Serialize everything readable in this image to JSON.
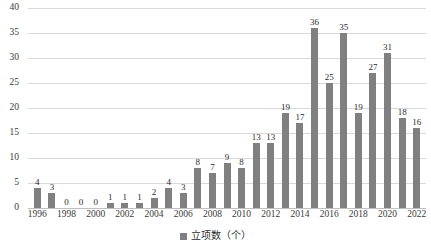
{
  "chart_data": {
    "type": "bar",
    "title": "",
    "subtitle": "",
    "xlabel": "",
    "ylabel": "",
    "ylim": [
      0,
      40
    ],
    "y_ticks": [
      0,
      5,
      10,
      15,
      20,
      25,
      30,
      35,
      40
    ],
    "grid": true,
    "legend_position": "bottom-center",
    "legend": [
      "立项数（个）"
    ],
    "series_color": "#808080",
    "data_labels_shown": true,
    "x_tick_interval": 2,
    "categories": [
      "1996",
      "1997",
      "1998",
      "1999",
      "2000",
      "2001",
      "2002",
      "2003",
      "2004",
      "2005",
      "2006",
      "2007",
      "2008",
      "2009",
      "2010",
      "2011",
      "2012",
      "2013",
      "2014",
      "2015",
      "2016",
      "2017",
      "2018",
      "2019",
      "2020",
      "2021",
      "2022"
    ],
    "x_tick_labels": [
      "1996",
      "",
      "1998",
      "",
      "2000",
      "",
      "2002",
      "",
      "2004",
      "",
      "2006",
      "",
      "2008",
      "",
      "2010",
      "",
      "2012",
      "",
      "2014",
      "",
      "2016",
      "",
      "2018",
      "",
      "2020",
      "",
      "2022"
    ],
    "series": [
      {
        "name": "立项数（个）",
        "values": [
          4,
          3,
          0,
          0,
          0,
          1,
          1,
          1,
          2,
          4,
          3,
          8,
          7,
          9,
          8,
          13,
          13,
          19,
          17,
          36,
          25,
          35,
          19,
          27,
          31,
          18,
          16
        ]
      }
    ]
  },
  "legend": {
    "label": "立项数（个）",
    "swatch_color": "#808080"
  }
}
